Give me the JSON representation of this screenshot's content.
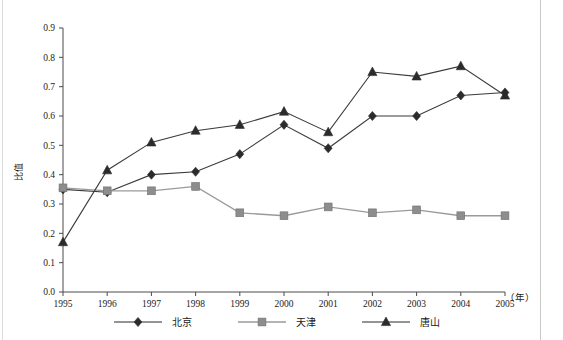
{
  "chart_data": {
    "type": "line",
    "title": "",
    "xlabel": "（年）",
    "ylabel": "比值",
    "x": [
      1995,
      1996,
      1997,
      1998,
      1999,
      2000,
      2001,
      2002,
      2003,
      2004,
      2005
    ],
    "xticklabels": [
      "1995",
      "1996",
      "1997",
      "1998",
      "1999",
      "2000",
      "2001",
      "2002",
      "2003",
      "2004",
      "2005"
    ],
    "yticklabels": [
      "0.0",
      "0.1",
      "0.2",
      "0.3",
      "0.4",
      "0.5",
      "0.6",
      "0.7",
      "0.8",
      "0.9"
    ],
    "ylim": [
      0.0,
      0.9
    ],
    "ytick_step": 0.1,
    "grid": false,
    "legend_position": "bottom",
    "series": [
      {
        "name": "北京",
        "marker": "diamond",
        "color": "#2b2b2b",
        "values": [
          0.35,
          0.34,
          0.4,
          0.41,
          0.47,
          0.57,
          0.49,
          0.6,
          0.6,
          0.67,
          0.68
        ]
      },
      {
        "name": "天津",
        "marker": "square",
        "color": "#8d8d8d",
        "values": [
          0.355,
          0.345,
          0.345,
          0.36,
          0.27,
          0.26,
          0.29,
          0.27,
          0.28,
          0.26,
          0.26
        ]
      },
      {
        "name": "唐山",
        "marker": "triangle",
        "color": "#2b2b2b",
        "values": [
          0.17,
          0.415,
          0.51,
          0.55,
          0.57,
          0.615,
          0.545,
          0.75,
          0.735,
          0.77,
          0.67
        ]
      }
    ]
  },
  "axis": {
    "y_title": "比值",
    "x_unit": "（年）"
  },
  "legend": {
    "items": [
      {
        "label": "北京",
        "marker": "diamond-marker"
      },
      {
        "label": "天津",
        "marker": "square-marker"
      },
      {
        "label": "唐山",
        "marker": "triangle-marker"
      }
    ]
  }
}
